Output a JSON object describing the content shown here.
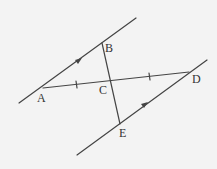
{
  "diagram": {
    "type": "geometry",
    "colors": {
      "background": "#f3f3f3",
      "stroke": "#444444",
      "text": "#333333"
    },
    "points": {
      "A": {
        "label": "A",
        "x": 43,
        "y": 88
      },
      "B": {
        "label": "B",
        "x": 102,
        "y": 43
      },
      "C": {
        "label": "C",
        "x": 110,
        "y": 81
      },
      "D": {
        "label": "D",
        "x": 189,
        "y": 72
      },
      "E": {
        "label": "E",
        "x": 120,
        "y": 124
      }
    },
    "lines": [
      {
        "name": "upper-parallel-line",
        "through": [
          "A",
          "B"
        ],
        "arrow": true
      },
      {
        "name": "lower-parallel-line",
        "through": [
          "E",
          "D"
        ],
        "arrow": true
      },
      {
        "name": "segment-AD",
        "through": [
          "A",
          "D"
        ],
        "tick_marks": [
          "AC",
          "CD"
        ]
      },
      {
        "name": "segment-BE",
        "through": [
          "B",
          "E"
        ]
      }
    ]
  }
}
